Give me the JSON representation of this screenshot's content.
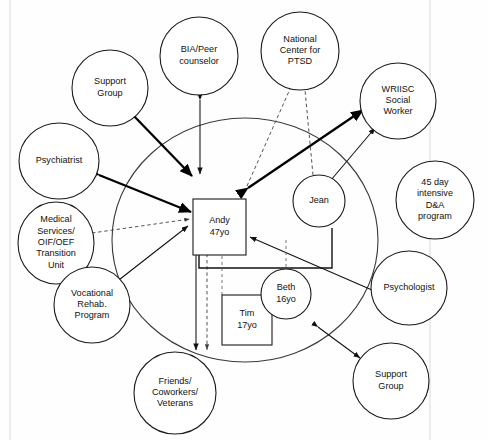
{
  "diagram": {
    "type": "ecomap-genogram",
    "family_boundary": {
      "label": "family-system-boundary",
      "cx": 245,
      "cy": 240,
      "rx": 133,
      "ry": 122
    }
  },
  "family": {
    "members": [
      {
        "id": "andy",
        "name": "Andy",
        "age": "47yo",
        "shape": "square",
        "x": 193,
        "y": 199,
        "w": 53,
        "h": 56,
        "role": "index-person"
      },
      {
        "id": "jean",
        "name": "Jean",
        "age": "",
        "shape": "circle",
        "x": 319,
        "y": 201,
        "r": 26,
        "role": "spouse"
      },
      {
        "id": "tim",
        "name": "Tim",
        "age": "17yo",
        "shape": "square",
        "x": 222,
        "y": 295,
        "w": 50,
        "h": 50,
        "role": "child"
      },
      {
        "id": "beth",
        "name": "Beth",
        "age": "16yo",
        "shape": "circle",
        "x": 286,
        "y": 294,
        "r": 25,
        "role": "child"
      }
    ]
  },
  "external_systems": [
    {
      "id": "support-group-top",
      "label": "Support Group",
      "lines": [
        "Support",
        "Group"
      ],
      "cx": 110,
      "cy": 88,
      "rx": 38,
      "ry": 38
    },
    {
      "id": "bia-peer",
      "label": "BIA/Peer counselor",
      "lines": [
        "BIA/Peer",
        "counselor"
      ],
      "cx": 199,
      "cy": 56,
      "rx": 39,
      "ry": 39
    },
    {
      "id": "ptsd-center",
      "label": "National Center for PTSD",
      "lines": [
        "National",
        "Center for",
        "PTSD"
      ],
      "cx": 300,
      "cy": 51,
      "rx": 39,
      "ry": 39
    },
    {
      "id": "wriisc-sw",
      "label": "WRIISC Social Worker",
      "lines": [
        "WRIISC",
        "Social",
        "Worker"
      ],
      "cx": 398,
      "cy": 101,
      "rx": 38,
      "ry": 38
    },
    {
      "id": "psychiatrist",
      "label": "Psychiatrist",
      "lines": [
        "Psychiatrist"
      ],
      "cx": 59,
      "cy": 161,
      "rx": 40,
      "ry": 38
    },
    {
      "id": "medical-services",
      "label": "Medical Services/ OIF/OEF Transition Unit",
      "lines": [
        "Medical",
        "Services/",
        "OIF/OEF",
        "Transition",
        "Unit"
      ],
      "cx": 56,
      "cy": 243,
      "rx": 38,
      "ry": 41
    },
    {
      "id": "voc-rehab",
      "label": "Vocational Rehab. Program",
      "lines": [
        "Vocational",
        "Rehab.",
        "Program"
      ],
      "cx": 92,
      "cy": 305,
      "rx": 38,
      "ry": 38
    },
    {
      "id": "friends-coworkers",
      "label": "Friends/ Coworkers/ Veterans",
      "lines": [
        "Friends/",
        "Coworkers/",
        "Veterans"
      ],
      "cx": 175,
      "cy": 393,
      "rx": 41,
      "ry": 41
    },
    {
      "id": "support-group-bot",
      "label": "Support Group",
      "lines": [
        "Support",
        "Group"
      ],
      "cx": 391,
      "cy": 381,
      "rx": 38,
      "ry": 38
    },
    {
      "id": "psychologist",
      "label": "Psychologist",
      "lines": [
        "Psychologist"
      ],
      "cx": 409,
      "cy": 288,
      "rx": 38,
      "ry": 37
    },
    {
      "id": "rehab-45day",
      "label": "45 day intensive D&A program",
      "lines": [
        "45 day",
        "intensive",
        "D&A",
        "program"
      ],
      "cx": 435,
      "cy": 200,
      "rx": 39,
      "ry": 39
    }
  ],
  "connections": [
    {
      "id": "andy-support-group-top",
      "from": "andy",
      "to": "support-group-top",
      "style": "bold",
      "arrows": "both",
      "meaning": "strong-reciprocal"
    },
    {
      "id": "andy-bia-peer",
      "from": "andy",
      "to": "bia-peer",
      "style": "solid",
      "arrows": "both",
      "meaning": "reciprocal"
    },
    {
      "id": "andy-psychiatrist",
      "from": "andy",
      "to": "psychiatrist",
      "style": "bold",
      "arrows": "both",
      "meaning": "strong-reciprocal"
    },
    {
      "id": "andy-wriisc-sw",
      "from": "andy",
      "to": "wriisc-sw",
      "style": "bold",
      "arrows": "both",
      "meaning": "strong-reciprocal"
    },
    {
      "id": "andy-ptsd-center",
      "from": "andy",
      "to": "ptsd-center",
      "style": "dashed",
      "arrows": "none",
      "meaning": "tenuous"
    },
    {
      "id": "jean-ptsd-center",
      "from": "jean",
      "to": "ptsd-center",
      "style": "dashed",
      "arrows": "none",
      "meaning": "tenuous"
    },
    {
      "id": "jean-wriisc-sw",
      "from": "jean",
      "to": "wriisc-sw",
      "style": "solid",
      "arrows": "both",
      "meaning": "reciprocal"
    },
    {
      "id": "andy-medical-services",
      "from": "andy",
      "to": "medical-services",
      "style": "dashed",
      "arrows": "to-andy",
      "meaning": "tenuous"
    },
    {
      "id": "andy-voc-rehab",
      "from": "andy",
      "to": "voc-rehab",
      "style": "solid",
      "arrows": "to-andy",
      "meaning": "one-way"
    },
    {
      "id": "andy-friends-solid",
      "from": "andy",
      "to": "friends-coworkers",
      "style": "solid",
      "arrows": "both",
      "meaning": "reciprocal"
    },
    {
      "id": "andy-friends-dashed",
      "from": "andy",
      "to": "friends-coworkers",
      "style": "dashed",
      "arrows": "both",
      "meaning": "tenuous"
    },
    {
      "id": "andy-psychologist",
      "from": "andy",
      "to": "psychologist",
      "style": "solid",
      "arrows": "to-andy",
      "meaning": "one-way"
    },
    {
      "id": "boundary-support-group-bot",
      "from": "family_boundary",
      "to": "support-group-bot",
      "style": "solid",
      "arrows": "both",
      "meaning": "reciprocal"
    },
    {
      "id": "rehab-45day-unlinked",
      "from": "rehab-45day",
      "to": "none",
      "style": "none",
      "arrows": "none",
      "meaning": "unconnected-resource"
    }
  ],
  "genogram_links": [
    {
      "id": "andy-jean-marriage",
      "from": "andy",
      "to": "jean",
      "style": "solid",
      "meaning": "marital-bond"
    },
    {
      "id": "andy-tim-child",
      "from": "andy",
      "to": "tim",
      "style": "dashed",
      "meaning": "parent-child"
    },
    {
      "id": "andy-beth-child",
      "from": "andy",
      "to": "beth",
      "style": "dashed",
      "meaning": "parent-child"
    },
    {
      "id": "jean-beth-child",
      "from": "jean",
      "to": "beth",
      "style": "dashed",
      "meaning": "parent-child"
    }
  ]
}
